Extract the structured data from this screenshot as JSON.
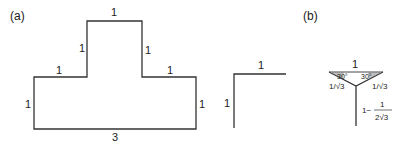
{
  "panels": {
    "a": {
      "label": "(a)",
      "edges": {
        "top": "1",
        "left_upper": "1",
        "right_upper": "1",
        "left_shoulder": "1",
        "right_shoulder": "1",
        "left_side": "1",
        "right_side": "1",
        "bottom": "3"
      }
    },
    "b": {
      "label": "(b)",
      "corner": {
        "top": "1",
        "side": "1"
      },
      "steiner": {
        "top": "1",
        "angle_left": "30°",
        "angle_right": "30°",
        "left_branch": "1/√3",
        "right_branch": "1/√3",
        "stem_prefix": "1−",
        "stem_num": "1",
        "stem_den": "2√3"
      }
    }
  },
  "colors": {
    "stroke": "#333333",
    "text": "#222222",
    "background": "#ffffff"
  }
}
